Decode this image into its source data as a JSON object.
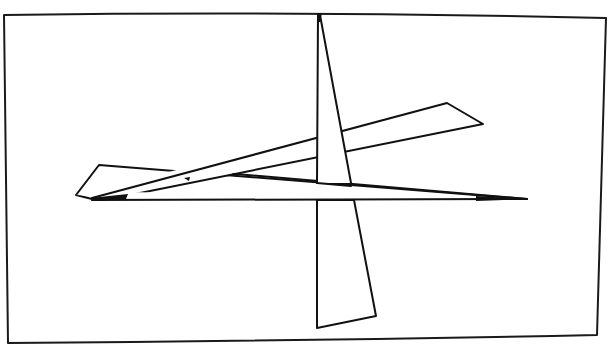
{
  "canvas": {
    "width": 609,
    "height": 347,
    "background": "#ffffff"
  },
  "colors": {
    "line": "#111111",
    "frame": "#1a1a1a",
    "fill": "#ffffff"
  },
  "frame": {
    "shape": "crt-screen-border",
    "corners": {
      "top_left": [
        4,
        14
      ],
      "top_right": [
        606,
        17
      ],
      "bottom_right": [
        597,
        335
      ],
      "bottom_left": [
        8,
        343
      ]
    }
  },
  "shapes": [
    {
      "id": "left-upper-arm",
      "type": "quadrilateral",
      "points": [
        [
          99,
          165
        ],
        [
          483,
          124
        ],
        [
          447,
          103
        ],
        [
          76,
          195
        ]
      ],
      "note": "long thin quad rising from the left toward the upper right"
    },
    {
      "id": "horizontal-bar",
      "type": "triangle",
      "points": [
        [
          92,
          199
        ],
        [
          527,
          199
        ],
        [
          125,
          197
        ]
      ],
      "note": "long thin sliver along y≈198 from left to the right tip"
    },
    {
      "id": "left-flag",
      "type": "quadrilateral",
      "points": [
        [
          76,
          195
        ],
        [
          99,
          165
        ],
        [
          527,
          199
        ],
        [
          92,
          199
        ]
      ],
      "note": "wide flag on the left narrowing to the right tip"
    },
    {
      "id": "vertical-blade",
      "type": "quadrilateral",
      "points": [
        [
          319,
          14
        ],
        [
          376,
          316
        ],
        [
          317,
          328
        ],
        [
          318,
          14
        ]
      ],
      "note": "tall blade from the top apex down to a slanted bottom edge"
    }
  ]
}
